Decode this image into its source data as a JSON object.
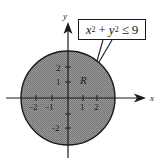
{
  "figure": {
    "region_label": "R",
    "inequality": {
      "text": "x^2 + y^2 ≤ 9",
      "var1": "x",
      "var2": "y",
      "exp": "2",
      "plus": "+",
      "rel": "≤",
      "rhs": "9"
    },
    "axes": {
      "x_label": "x",
      "y_label": "y",
      "x_ticks": [
        "-2",
        "-1",
        "1",
        "2"
      ],
      "y_ticks": [
        "2",
        "1",
        "-2"
      ]
    },
    "circle_radius": 3,
    "colors": {
      "fill": "#8c8c8c",
      "stroke": "#1a1a1a",
      "background": "#ffffff"
    }
  }
}
